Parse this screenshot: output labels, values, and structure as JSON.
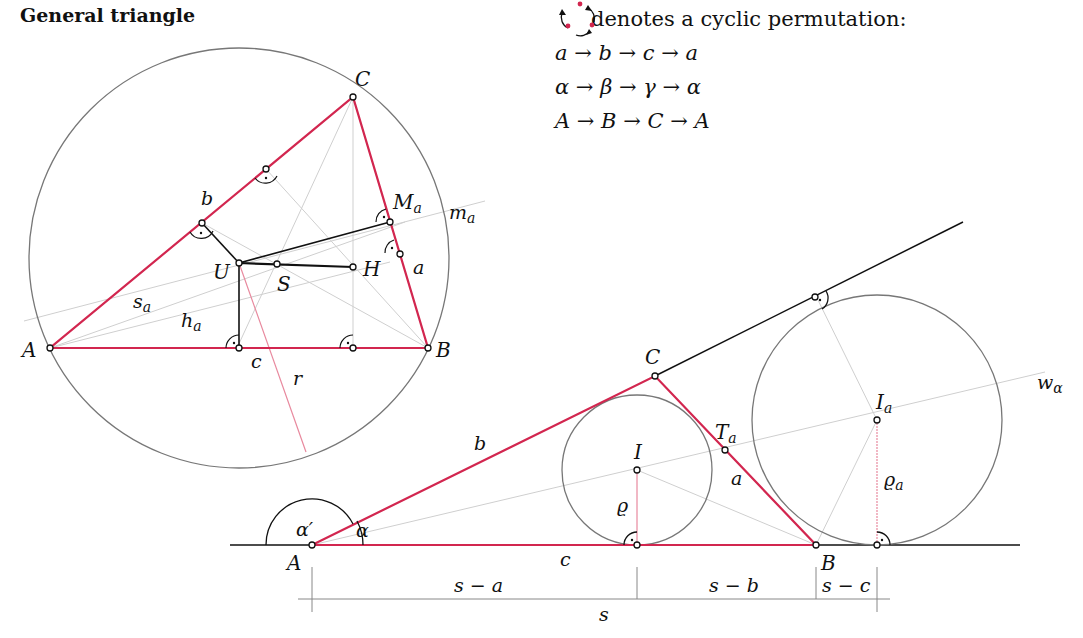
{
  "title": "General triangle",
  "legend": {
    "icon": "cyclic-permutation-icon",
    "heading": "denotes a cyclic permutation:",
    "rows": [
      "a → b → c → a",
      "α → β → γ → α",
      "A → B → C → A"
    ]
  },
  "colors": {
    "triangle": "#d2264f",
    "circle": "#777777",
    "construction": "#c8c8c8",
    "radius": "#e8899e",
    "ink": "#111111"
  },
  "figure1": {
    "vertices": {
      "A": "A",
      "B": "B",
      "C": "C"
    },
    "sides": {
      "a": "a",
      "b": "b",
      "c": "c"
    },
    "points": {
      "U": "U",
      "S": "S",
      "H": "H",
      "Ma": "M",
      "Ma_sub": "a"
    },
    "lines": {
      "ma": "m",
      "ma_sub": "a",
      "sa": "s",
      "sa_sub": "a",
      "ha": "h",
      "ha_sub": "a",
      "r": "r"
    }
  },
  "figure2": {
    "vertices": {
      "A": "A",
      "B": "B",
      "C": "C"
    },
    "sides": {
      "a": "a",
      "b": "b",
      "c": "c"
    },
    "points": {
      "I": "I",
      "Ia": "I",
      "Ia_sub": "a",
      "Ta": "T",
      "Ta_sub": "a"
    },
    "angles": {
      "alpha": "α",
      "alpha_prime": "α′"
    },
    "lines": {
      "w": "w",
      "w_sub": "α",
      "rho": "ϱ",
      "rho_a": "ϱ",
      "rho_a_sub": "a"
    },
    "dimensions": {
      "s_minus_a": "s − a",
      "s_minus_b": "s − b",
      "s_minus_c": "s − c",
      "s": "s"
    }
  }
}
